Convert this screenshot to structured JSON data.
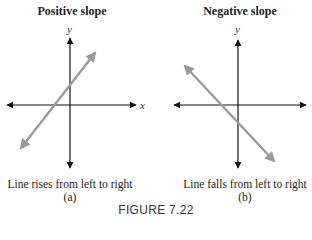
{
  "figure": {
    "label": "FIGURE 7.22",
    "panels": [
      {
        "title": "Positive slope",
        "caption": "Line rises from left to right",
        "sublabel": "(a)",
        "x_axis_label": "x",
        "y_axis_label": "y",
        "line_direction": "rises"
      },
      {
        "title": "Negative slope",
        "caption": "Line falls from left to right",
        "sublabel": "(b)",
        "x_axis_label": "x",
        "y_axis_label": "y",
        "line_direction": "falls"
      }
    ],
    "colors": {
      "axis": "#111111",
      "line": "#9a9a9a"
    }
  }
}
